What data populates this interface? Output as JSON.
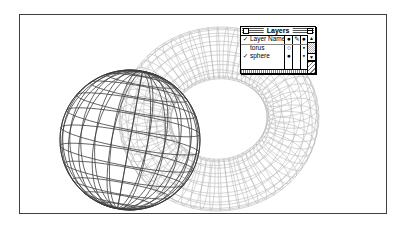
{
  "canvas": {
    "border_color": "#3f3f3f"
  },
  "wireframe": {
    "torus_color": "#b4b4b4",
    "sphere_color": "#3c3c3c"
  },
  "palette": {
    "title": "Layers",
    "header": {
      "check": "✓",
      "name_label": "Layer Name",
      "col_a_glyph": "●",
      "col_b_glyph": "✎",
      "col_c_glyph": "●"
    },
    "rows": [
      {
        "check": "",
        "name": "torus",
        "visibility": "○",
        "dot": "▪"
      },
      {
        "check": "✓",
        "name": "sphere",
        "visibility": "●",
        "dot": "▪"
      }
    ],
    "scrollbar": {
      "up_glyph": "▲",
      "down_glyph": "▼"
    }
  }
}
